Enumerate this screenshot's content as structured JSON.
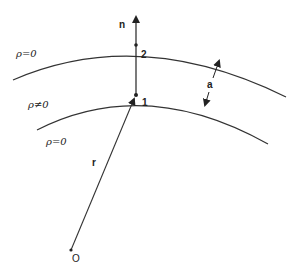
{
  "diagram": {
    "labels": {
      "normal": "n",
      "point_2": "2",
      "point_1": "1",
      "thickness": "a",
      "radius": "r",
      "origin": "O",
      "region_outer": "ρ=0",
      "region_shell": "ρ≠0",
      "region_inner": "ρ=0"
    },
    "colors": {
      "stroke": "#333333",
      "background": "#ffffff"
    }
  }
}
